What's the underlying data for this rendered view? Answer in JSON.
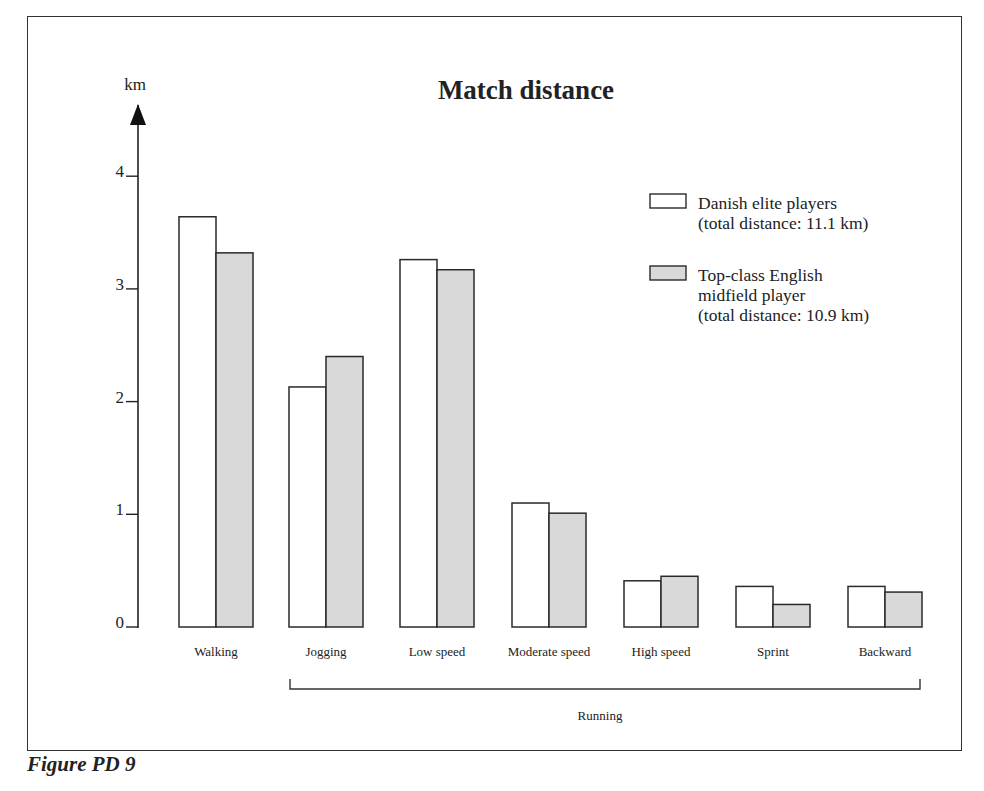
{
  "figure": {
    "caption": "Figure PD 9"
  },
  "chart_data": {
    "type": "bar",
    "title": "Match distance",
    "xlabel": "",
    "ylabel": "km",
    "ylim": [
      0,
      4.4
    ],
    "yticks": [
      0,
      1,
      2,
      3,
      4
    ],
    "grid": false,
    "legend_position": "upper right",
    "categories": [
      "Walking",
      "Jogging",
      "Low speed",
      "Moderate speed",
      "High speed",
      "Sprint",
      "Backward"
    ],
    "series": [
      {
        "name": "Danish elite players (total distance: 11.1 km)",
        "legend_lines": [
          "Danish elite players",
          "(total distance: 11.1 km)"
        ],
        "fill": "#ffffff",
        "values": [
          3.64,
          2.13,
          3.26,
          1.1,
          0.41,
          0.36,
          0.36
        ]
      },
      {
        "name": "Top-class English midfield player (total distance: 10.9 km)",
        "legend_lines": [
          "Top-class English",
          "midfield player",
          "(total distance: 10.9 km)"
        ],
        "fill": "#d9d9d9",
        "values": [
          3.32,
          2.4,
          3.17,
          1.01,
          0.45,
          0.2,
          0.31
        ]
      }
    ],
    "annotations": [
      {
        "type": "bracket",
        "label": "Running",
        "from_category": "Jogging",
        "to_category": "Backward"
      }
    ]
  }
}
